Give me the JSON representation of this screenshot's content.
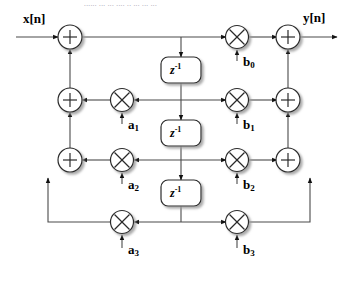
{
  "figure": {
    "title_cropped": "...... ... ... .... .. ... ... ...",
    "structure_name": "direct-form-II-iir-filter"
  },
  "io": {
    "input_label": "x[n]",
    "output_label": "y[n]"
  },
  "delays": [
    {
      "name": "delay-1",
      "label_base": "z",
      "label_exp": "-1",
      "cx": 181,
      "cy": 70
    },
    {
      "name": "delay-2",
      "label_base": "z",
      "label_exp": "-1",
      "cx": 181,
      "cy": 133
    },
    {
      "name": "delay-3",
      "label_base": "z",
      "label_exp": "-1",
      "cx": 181,
      "cy": 193
    }
  ],
  "feedback_coefficients": [
    {
      "label_base": "a",
      "label_sub": "1",
      "cx": 122,
      "cy": 100
    },
    {
      "label_base": "a",
      "label_sub": "2",
      "cx": 122,
      "cy": 160
    },
    {
      "label_base": "a",
      "label_sub": "3",
      "cx": 122,
      "cy": 222
    }
  ],
  "feedforward_coefficients": [
    {
      "label_base": "b",
      "label_sub": "0",
      "cx": 237,
      "cy": 37
    },
    {
      "label_base": "b",
      "label_sub": "1",
      "cx": 237,
      "cy": 100
    },
    {
      "label_base": "b",
      "label_sub": "2",
      "cx": 237,
      "cy": 160
    },
    {
      "label_base": "b",
      "label_sub": "3",
      "cx": 237,
      "cy": 222
    }
  ],
  "adders": {
    "left": [
      {
        "name": "adder-left-1",
        "cx": 70,
        "cy": 37
      },
      {
        "name": "adder-left-2",
        "cx": 70,
        "cy": 100
      },
      {
        "name": "adder-left-3",
        "cx": 70,
        "cy": 160
      }
    ],
    "right": [
      {
        "name": "adder-right-1",
        "cx": 288,
        "cy": 37
      },
      {
        "name": "adder-right-2",
        "cx": 288,
        "cy": 100
      },
      {
        "name": "adder-right-3",
        "cx": 288,
        "cy": 160
      }
    ]
  },
  "colors": {
    "line": "#4a4a4a",
    "node_stroke": "#2b2b2b",
    "node_fill": "#ffffff",
    "shadow": "#b8b8b8",
    "text": "#000000",
    "background": "#ffffff"
  }
}
